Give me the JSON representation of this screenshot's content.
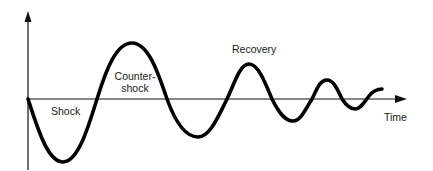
{
  "diagram": {
    "type": "damped-oscillation",
    "colors": {
      "background": "#ffffff",
      "axis": "#111111",
      "curve": "#000000",
      "text": "#1a1a1a"
    },
    "axes": {
      "x_label": "Time",
      "y_label": ""
    },
    "labels": {
      "shock": "Shock",
      "counter_shock_line1": "Counter-",
      "counter_shock_line2": "shock",
      "recovery": "Recovery"
    },
    "phases": [
      {
        "name": "Shock",
        "direction": "down",
        "relative_amplitude": 1.0
      },
      {
        "name": "Counter-shock",
        "direction": "up",
        "relative_amplitude": 0.9
      },
      {
        "name": "Recovery",
        "direction": "damped oscillation",
        "relative_amplitude": "decaying"
      }
    ]
  }
}
